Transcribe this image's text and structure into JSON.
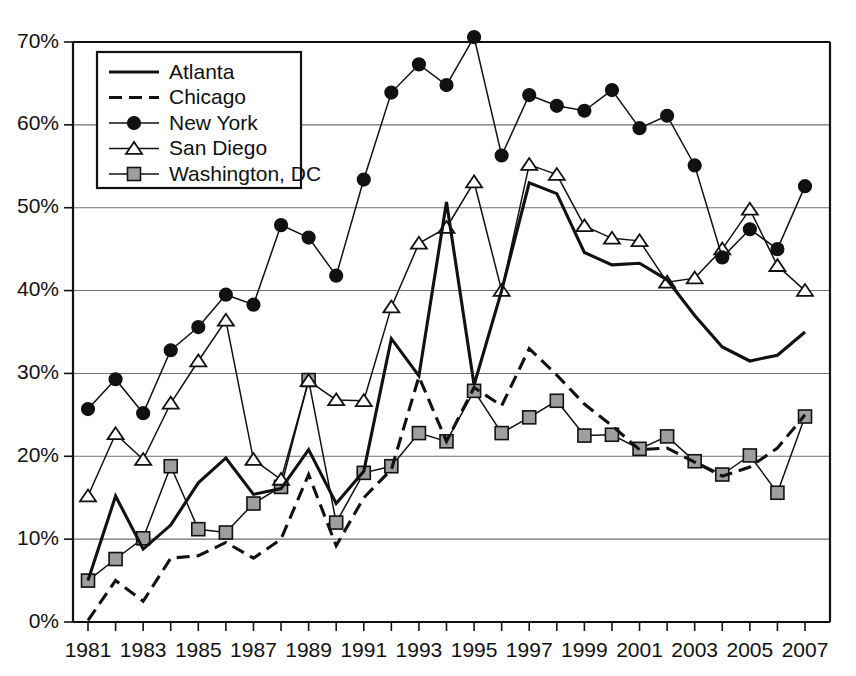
{
  "chart_data": {
    "type": "line",
    "title": "",
    "subtitle": "",
    "xlabel": "",
    "ylabel": "",
    "xlim": [
      1981,
      2007
    ],
    "ylim": [
      0,
      70
    ],
    "ytick_step": 10,
    "ytick_labels": [
      "0%",
      "10%",
      "20%",
      "30%",
      "40%",
      "50%",
      "60%",
      "70%"
    ],
    "ytick_values": [
      0,
      10,
      20,
      30,
      40,
      50,
      60,
      70
    ],
    "xtick_labels": [
      "1981",
      "1983",
      "1985",
      "1987",
      "1989",
      "1991",
      "1993",
      "1995",
      "1997",
      "1999",
      "2001",
      "2003",
      "2005",
      "2007"
    ],
    "xtick_values": [
      1981,
      1983,
      1985,
      1987,
      1989,
      1991,
      1993,
      1995,
      1997,
      1999,
      2001,
      2003,
      2005,
      2007
    ],
    "xtick_minor_values": [
      1982,
      1984,
      1986,
      1988,
      1990,
      1992,
      1994,
      1996,
      1998,
      2000,
      2002,
      2004,
      2006
    ],
    "grid": "horizontal",
    "legend_position": "top-left",
    "x": [
      1981,
      1982,
      1983,
      1984,
      1985,
      1986,
      1987,
      1988,
      1989,
      1990,
      1991,
      1992,
      1993,
      1994,
      1995,
      1996,
      1997,
      1998,
      1999,
      2000,
      2001,
      2002,
      2003,
      2004,
      2005,
      2006,
      2007
    ],
    "series": [
      {
        "name": "Atlanta",
        "marker": "none",
        "dash": "solid",
        "color": "#111111",
        "values": [
          5.0,
          15.2,
          8.8,
          11.7,
          16.8,
          19.8,
          15.4,
          16.1,
          20.8,
          14.3,
          18.2,
          34.2,
          29.7,
          50.7,
          28.6,
          40.0,
          53.0,
          51.7,
          44.6,
          43.1,
          43.3,
          41.3,
          37.0,
          33.2,
          31.5,
          32.2,
          35.0
        ]
      },
      {
        "name": "Chicago",
        "marker": "none",
        "dash": "dashed",
        "color": "#111111",
        "values": [
          0.2,
          5.0,
          2.5,
          7.7,
          8.0,
          9.6,
          7.7,
          10.0,
          17.8,
          9.2,
          15.0,
          18.4,
          29.6,
          21.8,
          28.3,
          26.1,
          33.0,
          29.8,
          26.3,
          23.7,
          20.8,
          21.0,
          19.3,
          17.6,
          18.7,
          21.0,
          25.0
        ]
      },
      {
        "name": "New York",
        "marker": "circle",
        "dash": "solid",
        "color": "#111111",
        "values": [
          25.7,
          29.3,
          25.2,
          32.8,
          35.6,
          39.5,
          38.3,
          47.9,
          46.4,
          41.8,
          53.4,
          63.9,
          67.3,
          64.8,
          70.6,
          56.3,
          63.6,
          62.3,
          61.7,
          64.2,
          59.6,
          61.1,
          55.1,
          44.0,
          47.4,
          45.0,
          52.6
        ]
      },
      {
        "name": "San Diego",
        "marker": "triangle",
        "dash": "solid",
        "color": "#111111",
        "values": [
          15.2,
          22.7,
          19.6,
          26.4,
          31.5,
          36.4,
          19.6,
          17.2,
          29.1,
          26.8,
          26.7,
          38.0,
          45.7,
          47.6,
          53.1,
          40.0,
          55.2,
          54.0,
          47.8,
          46.3,
          46.0,
          41.0,
          41.5,
          45.0,
          49.8,
          43.0,
          40.0
        ]
      },
      {
        "name": "Washington, DC",
        "marker": "square",
        "dash": "solid",
        "color": "#9e9e9e",
        "values": [
          5.0,
          7.6,
          10.1,
          18.8,
          11.2,
          10.8,
          14.3,
          16.3,
          29.2,
          12.0,
          18.0,
          18.8,
          22.8,
          21.8,
          27.9,
          22.8,
          24.7,
          26.7,
          22.5,
          22.6,
          20.9,
          22.4,
          19.4,
          17.8,
          20.1,
          15.6,
          24.8
        ]
      }
    ]
  },
  "legend": {
    "entries": [
      {
        "label": "Atlanta"
      },
      {
        "label": "Chicago"
      },
      {
        "label": "New York"
      },
      {
        "label": "San Diego"
      },
      {
        "label": "Washington, DC"
      }
    ]
  }
}
